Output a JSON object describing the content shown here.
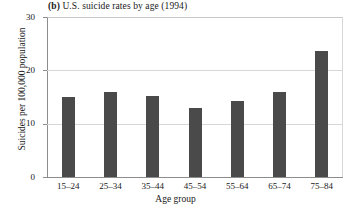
{
  "figure": {
    "panel_label": "(b)",
    "title": "U.S. suicide rates by age (1994)"
  },
  "axes": {
    "ylabel": "Suicides per 100,000 population",
    "xlabel": "Age group",
    "yticks": [
      "0",
      "10",
      "20",
      "30"
    ],
    "ymin": 0,
    "ymax": 30
  },
  "style": {
    "bar_color": "#4a4a4a",
    "grid_color": "#d7d7d7",
    "axis_color": "#8d8d8d",
    "background": "#ffffff"
  },
  "chart_data": {
    "type": "bar",
    "title": "(b) U.S. suicide rates by age (1994)",
    "xlabel": "Age group",
    "ylabel": "Suicides per 100,000 population",
    "categories": [
      "15–24",
      "25–34",
      "35–44",
      "45–54",
      "55–64",
      "65–74",
      "75–84"
    ],
    "values": [
      15.0,
      16.0,
      15.2,
      13.0,
      14.3,
      16.0,
      23.7
    ],
    "ylim": [
      0,
      30
    ],
    "yticks": [
      0,
      10,
      20,
      30
    ],
    "grid": true,
    "legend": null
  }
}
